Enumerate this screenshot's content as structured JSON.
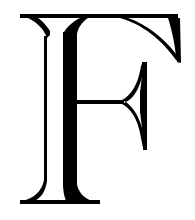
{
  "glyph": {
    "character": "F",
    "style": "decorative inline serif capital",
    "ink_color": "#000000",
    "background_color": "#ffffff"
  }
}
